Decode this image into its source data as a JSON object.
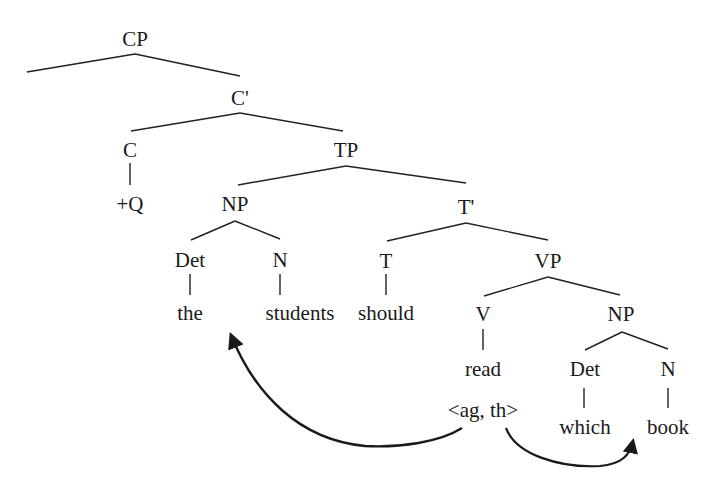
{
  "diagram": {
    "type": "syntax-tree",
    "colors": {
      "ink": "#1a1a1a",
      "background": "#ffffff"
    },
    "nodes": {
      "cp": "CP",
      "c_bar": "C'",
      "c": "C",
      "q": "+Q",
      "tp": "TP",
      "np_subj": "NP",
      "t_bar": "T'",
      "det_subj": "Det",
      "n_subj": "N",
      "t": "T",
      "vp": "VP",
      "the": "the",
      "students": "students",
      "should": "should",
      "v": "V",
      "np_obj": "NP",
      "read": "read",
      "theta_grid": "<ag, th>",
      "det_obj": "Det",
      "n_obj": "N",
      "which": "which",
      "book": "book"
    },
    "arrows": [
      {
        "from": "theta_grid.ag",
        "to": "the students",
        "role": "agent"
      },
      {
        "from": "theta_grid.th",
        "to": "which book",
        "role": "theme"
      }
    ]
  }
}
